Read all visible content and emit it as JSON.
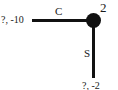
{
  "diagram": {
    "type": "game-tree",
    "node": {
      "player_label": "2"
    },
    "branches": [
      {
        "action": "C",
        "direction": "left",
        "payoff": "?, -10"
      },
      {
        "action": "S",
        "direction": "down",
        "payoff": "?, -2"
      }
    ]
  }
}
